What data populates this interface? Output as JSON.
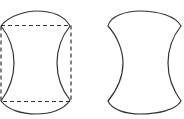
{
  "figure": {
    "colors": {
      "line": "#333333",
      "background": "#ffffff"
    },
    "shapes": [
      {
        "id": "left",
        "has_dashed_bounding_box": true
      },
      {
        "id": "right",
        "has_dashed_bounding_box": false
      }
    ]
  }
}
